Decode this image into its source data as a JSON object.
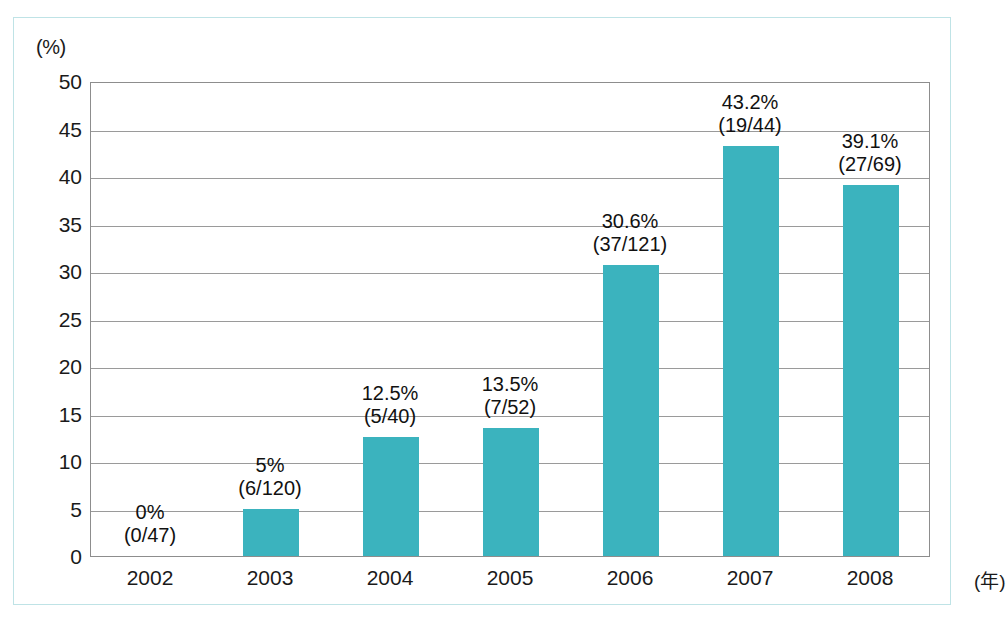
{
  "chart_data": {
    "type": "bar",
    "title": "",
    "subtitle": "",
    "xlabel": "",
    "ylabel": "",
    "y_unit_label": "(%)",
    "x_unit_label": "(年)",
    "categories": [
      "2002",
      "2003",
      "2004",
      "2005",
      "2006",
      "2007",
      "2008"
    ],
    "values": [
      0,
      5,
      12.5,
      13.5,
      30.6,
      43.2,
      39.1
    ],
    "point_labels": [
      "0%",
      "5%",
      "12.5%",
      "13.5%",
      "30.6%",
      "43.2%",
      "39.1%"
    ],
    "fractions": [
      "(0/47)",
      "(6/120)",
      "(5/40)",
      "(7/52)",
      "(37/121)",
      "(19/44)",
      "(27/69)"
    ],
    "numerators": [
      0,
      6,
      5,
      7,
      37,
      19,
      27
    ],
    "denominators": [
      47,
      120,
      40,
      52,
      121,
      44,
      69
    ],
    "ylim": [
      0,
      50
    ],
    "y_ticks": [
      50,
      45,
      40,
      35,
      30,
      25,
      20,
      15,
      10,
      5,
      0
    ],
    "grid": "horizontal",
    "legend": "none",
    "bar_color": "#3bb3be",
    "grid_color": "#9a9a9a",
    "axis_color": "#8d8d8d",
    "frame_color": "#bfe3e6",
    "background_color": "#ffffff"
  }
}
